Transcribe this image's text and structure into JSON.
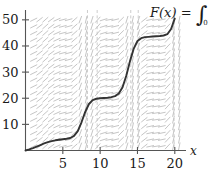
{
  "figure": {
    "title": "",
    "formula": {
      "lhs": "F(x) = ",
      "integral_symbol": "∫",
      "lower_limit": "0"
    }
  },
  "chart_data": {
    "type": "line",
    "title": "",
    "xlabel": "x",
    "ylabel": "",
    "xlim": [
      0,
      21.5
    ],
    "ylim": [
      0,
      53
    ],
    "grid": false,
    "legend": null,
    "x_ticks": [
      5,
      10,
      15,
      20
    ],
    "x_tick_labels": [
      "5",
      "10",
      "15",
      "20"
    ],
    "y_ticks": [
      10,
      20,
      30,
      40,
      50
    ],
    "y_tick_labels": [
      "10",
      "20",
      "30",
      "40",
      "50"
    ],
    "annotations": [
      "F(x) = ∫₀ˣ f(t) dt"
    ],
    "series": [
      {
        "name": "F(x)",
        "color": "#333333",
        "x": [
          0,
          0.5,
          1,
          1.5,
          2,
          2.5,
          3,
          3.5,
          4,
          4.5,
          5,
          5.5,
          6,
          6.5,
          7,
          7.5,
          8,
          8.5,
          9,
          9.5,
          10,
          10.5,
          11,
          11.5,
          12,
          12.5,
          13,
          13.5,
          14,
          14.5,
          15,
          15.5,
          16,
          16.5,
          17,
          17.5,
          18,
          18.5,
          19,
          19.5,
          20
        ],
        "y": [
          0,
          0.4,
          0.9,
          1.5,
          2.1,
          2.7,
          3.2,
          3.6,
          3.9,
          4.1,
          4.3,
          4.5,
          4.8,
          5.6,
          7.4,
          10.8,
          14.8,
          17.8,
          19.3,
          19.8,
          20.0,
          20.1,
          20.2,
          20.4,
          20.8,
          21.8,
          24.2,
          28.6,
          34.2,
          39.0,
          41.9,
          43.0,
          43.4,
          43.5,
          43.6,
          43.7,
          43.8,
          44.0,
          44.5,
          46.5,
          50.5
        ]
      }
    ],
    "slope_field": {
      "description": "direction field of short dashes; near-horizontal between steps, steep near x=8-9, 14-15, 20",
      "color": "#b0b0b0",
      "x_range": [
        0.5,
        21
      ],
      "y_range": [
        1,
        52
      ]
    },
    "vertical_dashed_lines": [
      8.3,
      9.6,
      14.1,
      15.1,
      19.9
    ]
  },
  "axes": {
    "x_axis_label": "x",
    "axis_color": "#555555"
  }
}
